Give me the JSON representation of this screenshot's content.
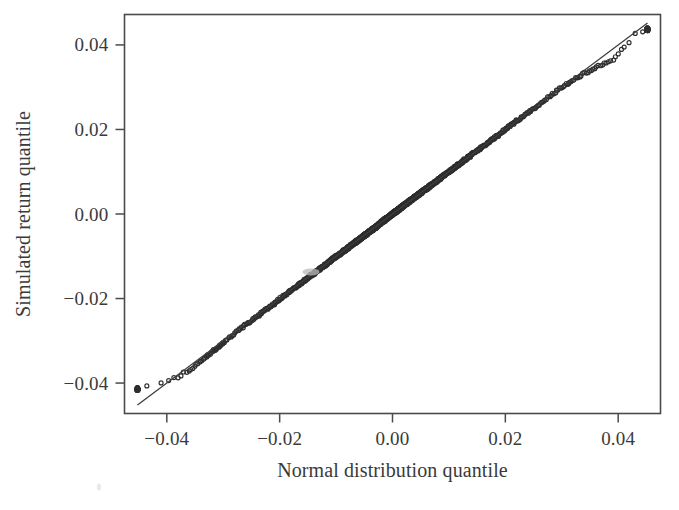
{
  "figure": {
    "kind": "qq-plot",
    "background_color": "#ffffff",
    "ink_color": "#3a3a3a",
    "point_stroke_color": "#2e2e2e",
    "reference_line_color": "#3e3e3e",
    "frame_color": "#4a4a4a"
  },
  "chart_data": {
    "type": "scatter",
    "title": "",
    "subtitle": "",
    "xlabel": "Normal distribution quantile",
    "ylabel": "Simulated return quantile",
    "xlim": [
      -0.0475,
      0.0475
    ],
    "ylim": [
      -0.0472,
      0.0472
    ],
    "xticks": [
      -0.04,
      -0.02,
      0.0,
      0.02,
      0.04
    ],
    "xtick_labels": [
      "−0.04",
      "−0.02",
      "0.00",
      "0.02",
      "0.04"
    ],
    "yticks": [
      -0.04,
      -0.02,
      0.0,
      0.02,
      0.04
    ],
    "ytick_labels": [
      "−0.04",
      "−0.02",
      "0.00",
      "0.02",
      "0.04"
    ],
    "grid": false,
    "legend": null,
    "legend_position": "none",
    "marker": "open-circle",
    "marker_size_px": 4.0,
    "n_points": 2000,
    "annotations": [],
    "reference_line": {
      "label": "theoretical quantile line",
      "slope": 1.0,
      "intercept": 0.0,
      "x_from": -0.0452,
      "x_to": 0.0452,
      "y_from": -0.0452,
      "y_to": 0.0452
    },
    "series": [
      {
        "name": "simulated vs normal quantiles",
        "description": "Quantile-quantile points; bulk lies on the 45-degree line, both tails bend above the line (light tails on the left, heavy-looking spread on the right).",
        "x": [
          -0.0452,
          -0.0411,
          -0.0393,
          -0.0381,
          -0.0372,
          -0.0364,
          -0.0357,
          -0.0351,
          -0.0345,
          -0.034,
          -0.0335,
          -0.033,
          -0.0326,
          -0.0321,
          -0.0317,
          -0.0313,
          -0.031,
          -0.0306,
          -0.0303,
          -0.0299,
          -0.029,
          -0.0281,
          -0.0272,
          -0.0263,
          -0.0254,
          -0.0245,
          -0.0236,
          -0.0227,
          -0.0218,
          -0.0209,
          -0.02,
          -0.019,
          -0.018,
          -0.017,
          -0.016,
          -0.015,
          -0.014,
          -0.013,
          -0.012,
          -0.011,
          -0.01,
          -0.009,
          -0.008,
          -0.007,
          -0.006,
          -0.005,
          -0.004,
          -0.003,
          -0.002,
          -0.001,
          0.0,
          0.001,
          0.002,
          0.003,
          0.004,
          0.005,
          0.006,
          0.007,
          0.008,
          0.009,
          0.01,
          0.011,
          0.012,
          0.013,
          0.014,
          0.015,
          0.016,
          0.017,
          0.018,
          0.019,
          0.02,
          0.0209,
          0.0218,
          0.0227,
          0.0236,
          0.0245,
          0.0254,
          0.0263,
          0.0272,
          0.0281,
          0.029,
          0.0299,
          0.0306,
          0.0313,
          0.032,
          0.0327,
          0.0334,
          0.0341,
          0.0348,
          0.0355,
          0.0362,
          0.0369,
          0.0376,
          0.0383,
          0.039,
          0.0398,
          0.0406,
          0.0415,
          0.0432,
          0.0452
        ],
        "y": [
          -0.0414,
          -0.04,
          -0.0392,
          -0.0386,
          -0.0379,
          -0.0371,
          -0.0366,
          -0.036,
          -0.0354,
          -0.0348,
          -0.0343,
          -0.0338,
          -0.0333,
          -0.0328,
          -0.0324,
          -0.0319,
          -0.0315,
          -0.0311,
          -0.0307,
          -0.0303,
          -0.0293,
          -0.0283,
          -0.0274,
          -0.0265,
          -0.0256,
          -0.0247,
          -0.0238,
          -0.0229,
          -0.022,
          -0.0211,
          -0.0201,
          -0.0191,
          -0.0181,
          -0.0171,
          -0.0161,
          -0.0151,
          -0.0141,
          -0.0131,
          -0.0121,
          -0.0111,
          -0.0101,
          -0.0091,
          -0.0081,
          -0.0071,
          -0.0061,
          -0.0051,
          -0.0041,
          -0.0031,
          -0.002,
          -0.001,
          0.0,
          0.001,
          0.002,
          0.003,
          0.004,
          0.005,
          0.006,
          0.007,
          0.008,
          0.009,
          0.01,
          0.011,
          0.012,
          0.013,
          0.014,
          0.015,
          0.016,
          0.017,
          0.018,
          0.019,
          0.02,
          0.0209,
          0.0218,
          0.0227,
          0.0236,
          0.0245,
          0.0254,
          0.0263,
          0.0272,
          0.0281,
          0.029,
          0.0298,
          0.0305,
          0.0311,
          0.0317,
          0.0323,
          0.0328,
          0.0333,
          0.0338,
          0.0343,
          0.0348,
          0.0353,
          0.0357,
          0.0361,
          0.0365,
          0.0375,
          0.0388,
          0.0402,
          0.0427,
          0.0437
        ]
      }
    ]
  }
}
